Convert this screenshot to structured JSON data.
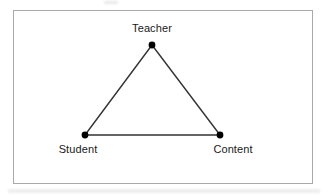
{
  "figure": {
    "type": "diagram",
    "shape": "triangle",
    "background_color": "#ffffff",
    "frame": {
      "border_color": "#a9a9a9",
      "border_width_px": 1,
      "x": 13,
      "y": 10,
      "width": 300,
      "height": 174
    },
    "edge_color": "#333333",
    "edge_width_px": 1.4,
    "node_color": "#000000",
    "node_radius_px": 3.4,
    "label_color": "#1a1a1a",
    "nodes": [
      {
        "id": "teacher",
        "label": "Teacher",
        "x": 152,
        "y": 45,
        "label_position": "above"
      },
      {
        "id": "student",
        "label": "Student",
        "x": 85,
        "y": 135,
        "label_position": "below"
      },
      {
        "id": "content",
        "label": "Content",
        "x": 220,
        "y": 135,
        "label_position": "below"
      }
    ],
    "edges": [
      {
        "from": "teacher",
        "to": "student"
      },
      {
        "from": "teacher",
        "to": "content"
      },
      {
        "from": "student",
        "to": "content"
      }
    ]
  }
}
